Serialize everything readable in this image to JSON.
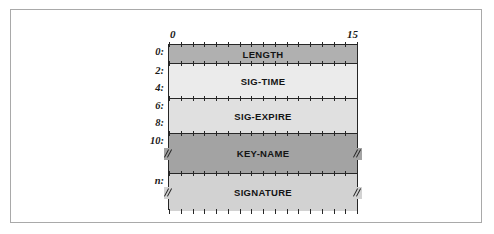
{
  "figure": {
    "kind": "packet-layout-diagram",
    "bit_ruler": {
      "start_label": "0",
      "end_label": "15",
      "tick_count": 16
    },
    "colors": {
      "outer_frame": "#a9a9a9",
      "stroke": "#262626",
      "page_background": "#ffffff",
      "length_fill": "#b0b0b0",
      "sig_time_fill": "#ebebeb",
      "sig_expire_fill": "#e0e0e0",
      "key_name_fill": "#a3a3a3",
      "signature_fill": "#d2d2d2"
    },
    "rows": [
      {
        "label": "LENGTH",
        "offset": "0:",
        "fill": "#b0b0b0",
        "height": 19,
        "truncated": false
      },
      {
        "label": "SIG-TIME",
        "offset": "2:",
        "offset_secondary": "4:",
        "fill": "#ebebeb",
        "height": 35,
        "truncated": false
      },
      {
        "label": "SIG-EXPIRE",
        "offset": "6:",
        "offset_secondary": "8:",
        "fill": "#e0e0e0",
        "height": 35,
        "truncated": false
      },
      {
        "label": "KEY-NAME",
        "offset": "10:",
        "fill": "#a3a3a3",
        "height": 40,
        "truncated": true
      },
      {
        "label": "SIGNATURE",
        "offset": "n:",
        "fill": "#d2d2d2",
        "height": 37,
        "truncated": true
      }
    ]
  }
}
